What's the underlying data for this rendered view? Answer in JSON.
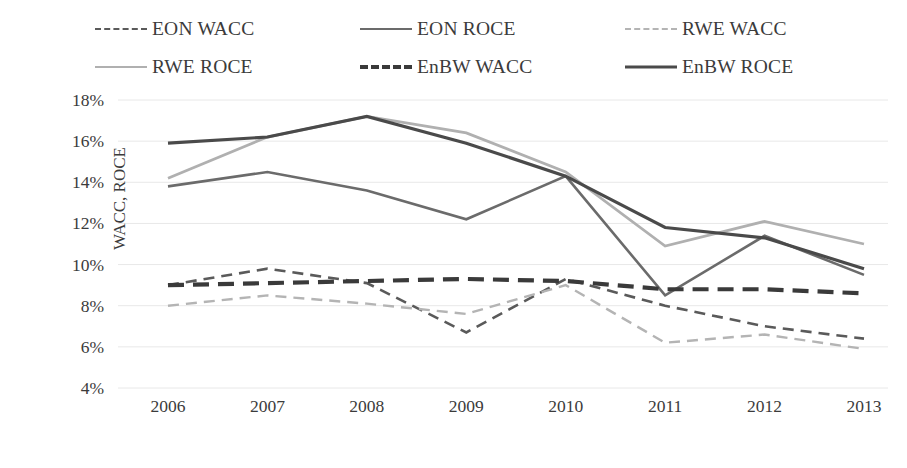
{
  "chart_data": {
    "type": "line",
    "title": "",
    "xlabel": "Year",
    "ylabel": "WACC, ROCE",
    "categories": [
      "2006",
      "2007",
      "2008",
      "2009",
      "2010",
      "2011",
      "2012",
      "2013"
    ],
    "x": [
      2006,
      2007,
      2008,
      2009,
      2010,
      2011,
      2012,
      2013
    ],
    "ylim": [
      4,
      18
    ],
    "ytick_values": [
      4,
      6,
      8,
      10,
      12,
      14,
      16,
      18
    ],
    "ytick_labels": [
      "4%",
      "6%",
      "8%",
      "10%",
      "12%",
      "14%",
      "16%",
      "18%"
    ],
    "grid": true,
    "legend_position": "top",
    "units": "percent",
    "series": [
      {
        "name": "EON WACC",
        "label": "EON WACC",
        "style": "dashed",
        "color": "#5a5a5a",
        "width": 2.6,
        "values": [
          9.0,
          9.8,
          9.1,
          6.7,
          9.3,
          8.0,
          7.0,
          6.4
        ]
      },
      {
        "name": "EON ROCE",
        "label": "EON ROCE",
        "style": "solid",
        "color": "#6b6b6b",
        "width": 2.6,
        "values": [
          13.8,
          14.5,
          13.6,
          12.2,
          14.3,
          8.5,
          11.4,
          9.5
        ]
      },
      {
        "name": "RWE WACC",
        "label": "RWE WACC",
        "style": "dashed",
        "color": "#b4b4b4",
        "width": 2.4,
        "values": [
          8.0,
          8.5,
          8.1,
          7.6,
          9.0,
          6.2,
          6.6,
          5.9
        ]
      },
      {
        "name": "RWE ROCE",
        "label": "RWE ROCE",
        "style": "solid",
        "color": "#b0b0b0",
        "width": 2.8,
        "values": [
          14.2,
          16.2,
          17.2,
          16.4,
          14.5,
          10.9,
          12.1,
          11.0
        ]
      },
      {
        "name": "EnBW WACC",
        "label": "EnBW WACC",
        "style": "dashed-thick",
        "color": "#3a3a3a",
        "width": 4.2,
        "values": [
          9.0,
          9.1,
          9.2,
          9.3,
          9.2,
          8.8,
          8.8,
          8.6
        ]
      },
      {
        "name": "EnBW ROCE",
        "label": "EnBW ROCE",
        "style": "solid",
        "color": "#4a4a4a",
        "width": 3.2,
        "values": [
          15.9,
          16.2,
          17.2,
          15.9,
          14.3,
          11.8,
          11.3,
          9.8
        ]
      }
    ]
  },
  "legend": {
    "rows": [
      [
        {
          "label": "EON WACC",
          "key": "eon-wacc"
        },
        {
          "label": "EON ROCE",
          "key": "eon-roce"
        },
        {
          "label": "RWE WACC",
          "key": "rwe-wacc"
        }
      ],
      [
        {
          "label": "RWE ROCE",
          "key": "rwe-roce"
        },
        {
          "label": "EnBW WACC",
          "key": "enbw-wacc"
        },
        {
          "label": "EnBW ROCE",
          "key": "enbw-roce"
        }
      ]
    ]
  },
  "colors": {
    "grid": "#e8e8e8",
    "text": "#3b3b3b",
    "background": "#ffffff"
  }
}
